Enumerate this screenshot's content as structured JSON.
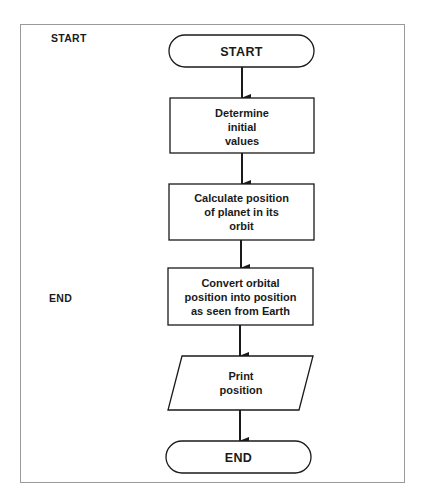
{
  "legend": {
    "start_label": "START",
    "end_label": "END"
  },
  "flowchart": {
    "nodes": [
      {
        "id": "start",
        "shape": "terminal",
        "lines": [
          "START"
        ]
      },
      {
        "id": "init",
        "shape": "process",
        "lines": [
          "Determine",
          "initial",
          "values"
        ]
      },
      {
        "id": "calc",
        "shape": "process",
        "lines": [
          "Calculate position",
          "of planet in its",
          "orbit"
        ]
      },
      {
        "id": "convert",
        "shape": "process",
        "lines": [
          "Convert orbital",
          "position into position",
          "as seen from Earth"
        ]
      },
      {
        "id": "print",
        "shape": "io",
        "lines": [
          "Print",
          "position"
        ]
      },
      {
        "id": "end",
        "shape": "terminal",
        "lines": [
          "END"
        ]
      }
    ],
    "edges": [
      {
        "from": "start",
        "to": "init"
      },
      {
        "from": "init",
        "to": "calc"
      },
      {
        "from": "calc",
        "to": "convert"
      },
      {
        "from": "convert",
        "to": "print"
      },
      {
        "from": "print",
        "to": "end"
      }
    ]
  },
  "colors": {
    "stroke": "#1a1a1a",
    "frame": "#9a9a9a",
    "background": "#ffffff"
  }
}
